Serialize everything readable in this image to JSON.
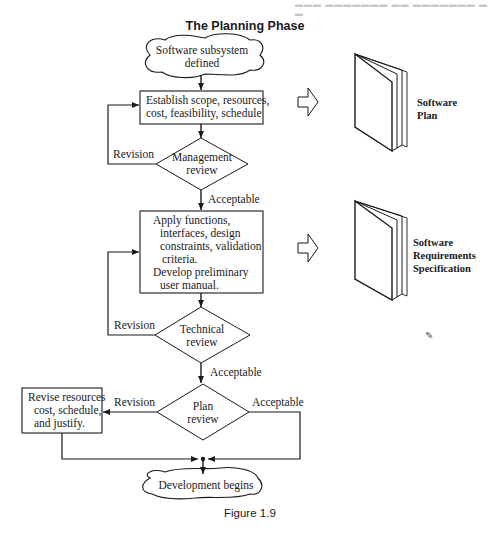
{
  "title": "The Planning Phase",
  "caption": "Figure 1.9",
  "nodes": {
    "start": {
      "type": "cloud",
      "lines": [
        "Software subsystem",
        "defined"
      ]
    },
    "establish": {
      "type": "process",
      "lines": [
        "Establish scope, resources,",
        "cost, feasibility, schedule"
      ]
    },
    "management_review": {
      "type": "decision",
      "lines": [
        "Management",
        "review"
      ]
    },
    "apply": {
      "type": "process",
      "lines": [
        "Apply functions,",
        "interfaces, design",
        "constraints, validation",
        "criteria.",
        "Develop preliminary",
        "user manual."
      ]
    },
    "technical_review": {
      "type": "decision",
      "lines": [
        "Technical",
        "review"
      ]
    },
    "plan_review": {
      "type": "decision",
      "lines": [
        "Plan",
        "review"
      ]
    },
    "revise": {
      "type": "process",
      "lines": [
        "Revise resources",
        "cost, schedule,",
        "and justify."
      ]
    },
    "end": {
      "type": "cloud",
      "lines": [
        "Development begins"
      ]
    }
  },
  "edge_labels": {
    "mgmt_revision": "Revision",
    "mgmt_acceptable": "Acceptable",
    "tech_revision": "Revision",
    "tech_acceptable": "Acceptable",
    "plan_revision": "Revision",
    "plan_acceptable": "Acceptable"
  },
  "outputs": [
    {
      "label_lines": [
        "Software",
        "Plan"
      ],
      "icon": "document-booklet-icon"
    },
    {
      "label_lines": [
        "Software",
        "Requirements",
        "Specification"
      ],
      "icon": "document-booklet-icon"
    }
  ],
  "colors": {
    "ink": "#1a1a1a",
    "background": "#ffffff"
  }
}
